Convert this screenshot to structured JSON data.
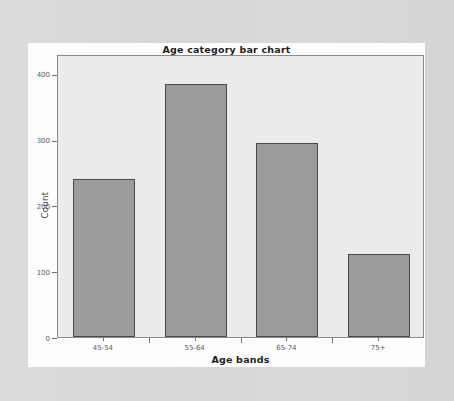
{
  "chart_data": {
    "type": "bar",
    "title": "Age category bar chart",
    "xlabel": "Age bands",
    "ylabel": "Count",
    "categories": [
      "45-54",
      "55-64",
      "65-74",
      "75+"
    ],
    "values": [
      240,
      385,
      295,
      126
    ],
    "ytick_labels": [
      "0",
      "100",
      "200",
      "300",
      "400"
    ],
    "ytick_values": [
      0,
      100,
      200,
      300,
      400
    ],
    "ylim": [
      0,
      430
    ],
    "grid": false,
    "legend": false,
    "bar_color": "#9b9b9b",
    "bar_edge_color": "#4a4a4a",
    "plot_background": "#ebebeb",
    "page_background": "#d8d8d8"
  }
}
